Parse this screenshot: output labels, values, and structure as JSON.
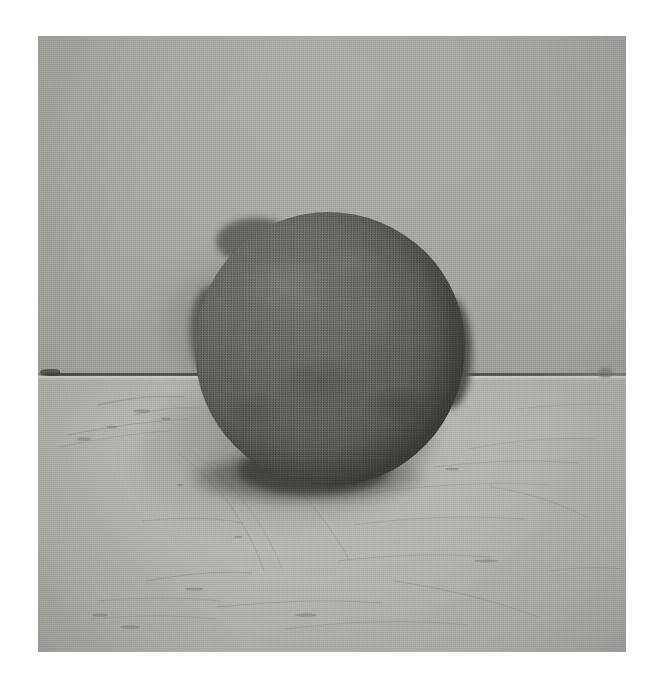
{
  "image": {
    "kind": "photograph",
    "subject": "rough hand-formed clay ball resting on a table against a plain wall",
    "orientation": "portrait",
    "border_color": "#ffffff",
    "alt_text": "A grainy black-and-white photograph of a roughly spherical lump of dark clay sitting on a light scratched table surface in front of a plain pale wall."
  },
  "scene": {
    "background_plane": {
      "name": "wall",
      "color": "#cfcfcd",
      "description": "plain pale gray wall filling the upper half of the frame"
    },
    "foreground_plane": {
      "name": "table-top",
      "color": "#d6d6d4",
      "description": "light gray scratched table surface filling the lower half of the frame"
    },
    "horizon_line": {
      "name": "wall-table-seam",
      "color": "#3c3c3a",
      "description": "thin dark seam where the table meets the wall, crossing the frame horizontally"
    },
    "object": {
      "name": "clay-ball",
      "color": "#5a5a58",
      "shadow_color": "#3a3a38",
      "description": "dark gray irregular sphere of clay, roughly centered, its lower half overlapping the table"
    },
    "shadows": [
      {
        "name": "wall-shadow",
        "description": "soft shadow cast on the wall to the left of the ball"
      },
      {
        "name": "table-shadow",
        "description": "soft shadow cast on the table to the lower left of the ball"
      },
      {
        "name": "contact-shadow",
        "description": "dark contact shadow directly beneath the ball"
      }
    ],
    "marks": [
      {
        "name": "seam-nick-left",
        "description": "small dark nick on the seam at the far left edge"
      },
      {
        "name": "seam-nick-right",
        "description": "small gray nick on the seam toward the right edge"
      },
      {
        "name": "table-scratches",
        "description": "faint scratches and scuff lines across the table surface"
      }
    ]
  }
}
